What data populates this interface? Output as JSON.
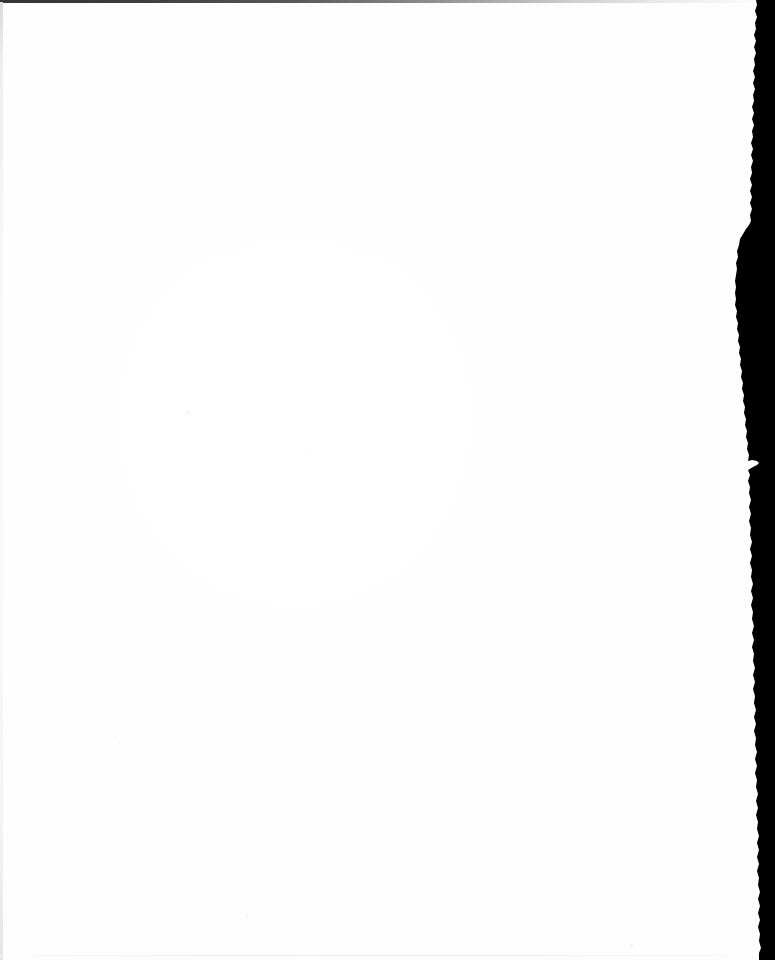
{
  "document": {
    "kind": "scanned-page-image",
    "page_content": "",
    "page_note": "",
    "visible_text": "",
    "width_px": 775,
    "height_px": 960
  },
  "page": {
    "background_color": "#ffffff",
    "surface_label": "",
    "has_text": false,
    "has_figures": false,
    "has_page_number": false
  },
  "scan_artifacts": {
    "right_edge": {
      "name": "ragged dark scanner margin",
      "color": "#000000",
      "from_x": 746,
      "to_x": 775,
      "widest_at_y": 295
    },
    "top_edge": {
      "name": "dark scan line",
      "color": "#343434",
      "height_px": 3,
      "fades_to": "#ffffff"
    },
    "left_edge": {
      "name": "faint gray hairline",
      "color": "#e8e8e8",
      "width_px": 3
    },
    "bottom_edge": {
      "name": "faint gray hairline",
      "color": "#efefef",
      "height_px": 1
    },
    "specks": [
      {
        "x": 186,
        "y": 411,
        "size": 3,
        "color": "#f4f4f6"
      },
      {
        "x": 308,
        "y": 453,
        "size": 2,
        "color": "#f6f6f8"
      },
      {
        "x": 245,
        "y": 915,
        "size": 3,
        "color": "#f5f5f5"
      },
      {
        "x": 630,
        "y": 944,
        "size": 3,
        "color": "#f3f3f3"
      },
      {
        "x": 118,
        "y": 742,
        "size": 2,
        "color": "#f7f7f7"
      }
    ]
  }
}
